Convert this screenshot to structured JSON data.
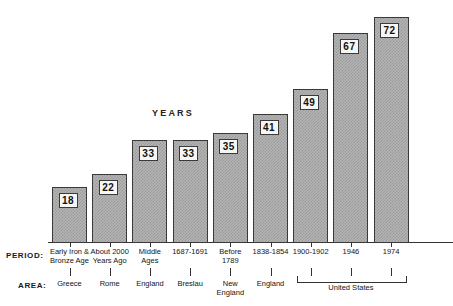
{
  "chart_data": {
    "type": "bar",
    "title": "YEARS",
    "xlabel": "",
    "ylabel": "YEARS",
    "ylim": [
      0,
      76
    ],
    "grid": false,
    "legend": "none",
    "row_headers": {
      "period": "PERIOD:",
      "area": "AREA:"
    },
    "categories": [
      "Early Iron & Bronze Age",
      "About 2000 Years Ago",
      "Middle Ages",
      "1687-1691",
      "Before 1789",
      "1838-1854",
      "1900-1902",
      "1946",
      "1974"
    ],
    "values": [
      18,
      22,
      33,
      33,
      35,
      41,
      49,
      67,
      72
    ],
    "period_labels": [
      [
        "Early Iron &",
        "Bronze Age"
      ],
      [
        "About 2000",
        "Years Ago"
      ],
      [
        "Middle",
        "Ages"
      ],
      [
        "1687-1691"
      ],
      [
        "Before",
        "1789"
      ],
      [
        "1838-1854"
      ],
      [
        "1900-1902"
      ],
      [
        "1946"
      ],
      [
        "1974"
      ]
    ],
    "area_labels": [
      [
        "Greece"
      ],
      [
        "Rome"
      ],
      [
        "England"
      ],
      [
        "Breslau"
      ],
      [
        "New",
        "England"
      ],
      [
        "England"
      ],
      [
        ""
      ],
      [
        ""
      ],
      [
        ""
      ]
    ],
    "groups": [
      {
        "label": "United States",
        "from": 6,
        "to": 8
      }
    ],
    "colors": {
      "bar_fill": "#b4b4b4",
      "bar_hatch": "#9a9a9a",
      "bar_border": "#3a3a3a",
      "value_box_bg": "#f6f6f4",
      "axis": "#333333",
      "background": "#ffffff",
      "text": "#141414"
    }
  }
}
